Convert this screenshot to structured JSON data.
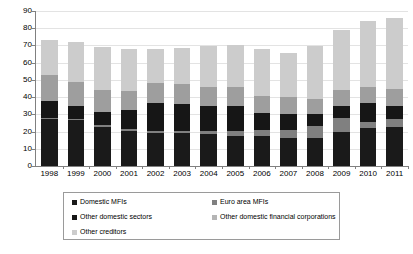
{
  "chart_data": {
    "type": "bar",
    "stacked": true,
    "title": "",
    "subtitle": "",
    "xlabel": "",
    "ylabel": "",
    "ylim": [
      0,
      90
    ],
    "y_ticks": [
      0,
      10,
      20,
      30,
      40,
      50,
      60,
      70,
      80,
      90
    ],
    "grid": true,
    "legend_position": "bottom",
    "categories": [
      "1998",
      "1999",
      "2000",
      "2001",
      "2002",
      "2003",
      "2004",
      "2005",
      "2006",
      "2007",
      "2008",
      "2009",
      "2010",
      "2011"
    ],
    "series": [
      {
        "name": "Domestic MFIs",
        "color": "#1a1a1a",
        "values": [
          27.5,
          27.0,
          22.5,
          20.5,
          19.0,
          19.0,
          18.5,
          17.5,
          17.5,
          16.0,
          16.5,
          19.5,
          22.0,
          22.5
        ]
      },
      {
        "name": "Euro area MFIs",
        "color": "#808080",
        "values": [
          0.5,
          0.5,
          1.5,
          1.0,
          1.5,
          1.5,
          2.0,
          3.0,
          3.5,
          5.0,
          7.0,
          8.5,
          3.5,
          5.0
        ]
      },
      {
        "name": "Other domestic sectors",
        "color": "#161616",
        "values": [
          10.0,
          7.5,
          7.5,
          11.0,
          16.0,
          15.5,
          14.5,
          14.5,
          10.0,
          9.0,
          7.0,
          7.0,
          11.0,
          7.5
        ]
      },
      {
        "name": "Other domestic financial corporations",
        "color": "#9e9e9e",
        "values": [
          15.0,
          13.5,
          12.5,
          11.0,
          11.5,
          11.5,
          11.0,
          11.0,
          9.5,
          10.0,
          8.5,
          9.0,
          9.5,
          9.5
        ]
      },
      {
        "name": "Other creditors",
        "color": "#cccccc",
        "values": [
          20.0,
          23.5,
          25.0,
          24.5,
          20.0,
          21.0,
          23.5,
          24.0,
          27.5,
          25.5,
          30.5,
          35.0,
          38.5,
          41.5
        ]
      }
    ],
    "totals": [
      73.0,
      72.0,
      69.0,
      68.0,
      68.0,
      68.5,
      69.5,
      70.0,
      68.0,
      65.5,
      69.5,
      79.0,
      84.5,
      86.0
    ]
  },
  "axis": {
    "y_tick_labels": [
      "0",
      "10",
      "20",
      "30",
      "40",
      "50",
      "60",
      "70",
      "80",
      "90"
    ],
    "x_tick_labels": [
      "1998",
      "1999",
      "2000",
      "2001",
      "2002",
      "2003",
      "2004",
      "2005",
      "2006",
      "2007",
      "2008",
      "2009",
      "2010",
      "2011"
    ]
  },
  "legend": {
    "items": [
      {
        "label": "Domestic MFIs",
        "color": "#1a1a1a"
      },
      {
        "label": "Euro area MFIs",
        "color": "#808080"
      },
      {
        "label": "Other domestic sectors",
        "color": "#161616"
      },
      {
        "label": "Other domestic financial corporations",
        "color": "#b5b5b5"
      },
      {
        "label": "Other creditors",
        "color": "#cccccc"
      }
    ]
  }
}
